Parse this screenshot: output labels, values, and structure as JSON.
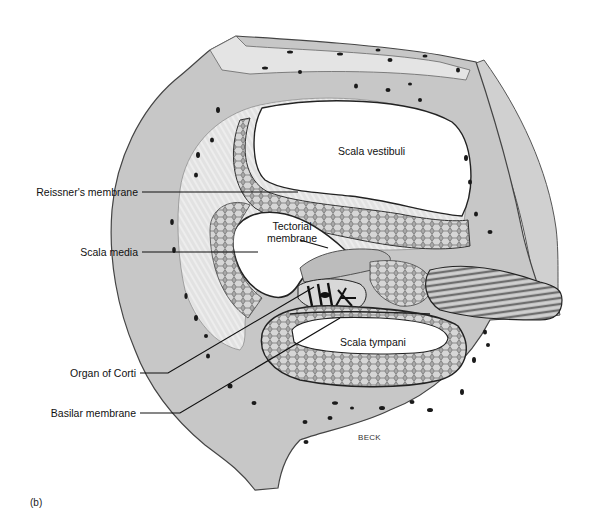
{
  "figure": {
    "panel_label": "(b)",
    "credit": "BECK",
    "colors": {
      "bone": "#c9c9c9",
      "bone_light": "#dcdcdc",
      "membrane": "#9a9a9a",
      "outline": "#2a2a2a",
      "cavity": "#ffffff",
      "leader": "#111111"
    },
    "left_labels": [
      {
        "id": "reissners-membrane",
        "text": "Reissner's membrane"
      },
      {
        "id": "scala-media",
        "text": "Scala media"
      },
      {
        "id": "organ-of-corti",
        "text": "Organ of Corti"
      },
      {
        "id": "basilar-membrane",
        "text": "Basilar membrane"
      }
    ],
    "inner_labels": [
      {
        "id": "scala-vestibuli",
        "text": "Scala vestibuli"
      },
      {
        "id": "tectorial-membrane",
        "line1": "Tectorial",
        "line2": "membrane"
      },
      {
        "id": "scala-tympani",
        "text": "Scala tympani"
      }
    ]
  }
}
